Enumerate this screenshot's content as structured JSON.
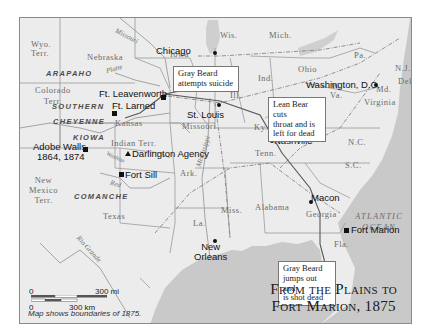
{
  "title": {
    "line1": "From the Plains to",
    "line2": "Fort Marion, 1875"
  },
  "scale": {
    "zero_mi": "0",
    "mi_label": "300 mi",
    "zero_km": "0",
    "km_label": "300 km",
    "note": "Map shows boundaries of 1875."
  },
  "states": {
    "wyo": "Wyo.\nTerr.",
    "wyo_l1": "Wyo.",
    "wyo_l2": "Terr.",
    "nebraska": "Nebraska",
    "iowa": "Iowa",
    "wis": "Wis.",
    "mich": "Mich.",
    "pa": "Pa.",
    "nj": "N.J.",
    "del": "Del.",
    "md": "Md.",
    "ohio": "Ohio",
    "ind": "Ind.",
    "ill": "Ill.",
    "colorado_l1": "Colorado",
    "colorado_l2": "Terr.",
    "kansas": "Kansas",
    "missouri": "Missouri",
    "wva_l1": "W.",
    "wva_l2": "Va.",
    "virginia": "Virginia",
    "ky": "Ky.",
    "tenn": "Tenn.",
    "nc": "N.C.",
    "sc": "S.C.",
    "indian_terr": "Indian  Terr.",
    "newmexico_l1": "New",
    "newmexico_l2": "Mexico",
    "newmexico_l3": "Terr.",
    "ark": "Ark.",
    "miss": "Miss.",
    "alabama": "Alabama",
    "georgia": "Georgia",
    "la": "La.",
    "texas": "Texas",
    "fla": "Fla."
  },
  "tribes": {
    "arapaho": "ARAPAHO",
    "southern": "SOUTHERN",
    "cheyenne": "CHEYENNE",
    "kiowa": "KIOWA",
    "comanche": "COMANCHE"
  },
  "rivers": {
    "missouri": "Missouri",
    "platte": "Platte",
    "washita": "Washita",
    "red": "Red",
    "rio_grande": "Rio Grande",
    "mississippi": "Mississippi"
  },
  "oceans": {
    "atlantic_l1": "ATLANTIC",
    "atlantic_l2": "OCEAN"
  },
  "places": {
    "chicago": "Chicago",
    "ft_leavenworth": "Ft. Leavenworth",
    "ft_larned": "Ft. Larned",
    "st_louis": "St. Louis",
    "washington": "Washington, D.C.",
    "nashville": "Nashville",
    "adobe_walls_l1": "Adobe Walls,",
    "adobe_walls_l2": "1864, 1874",
    "darlington": "Darlington Agency",
    "fort_sill": "Fort Sill",
    "macon": "Macon",
    "new_orleans_l1": "New",
    "new_orleans_l2": "Orleans",
    "fort_marion": "Fort Marion"
  },
  "callouts": {
    "gray_beard_suicide_l1": "Gray Beard",
    "gray_beard_suicide_l2": "attempts suicide",
    "lean_bear_l1": "Lean Bear cuts",
    "lean_bear_l2": "throat and is",
    "lean_bear_l3": "left for dead",
    "gray_beard_dead_l1": "Gray Beard",
    "gray_beard_dead_l2": "jumps out and",
    "gray_beard_dead_l3": "is shot dead"
  },
  "colors": {
    "land": "#ececec",
    "water": "#c9c9c9",
    "border": "#9a9a9a",
    "route": "#555555"
  }
}
